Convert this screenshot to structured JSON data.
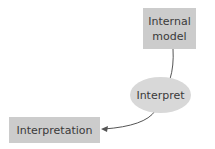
{
  "nodes": {
    "internal_model": {
      "line1": "Internal",
      "line2": "model"
    },
    "interpret": {
      "label": "Interpret"
    },
    "interpretation": {
      "label": "Interpretation"
    }
  },
  "edges": [
    {
      "from": "internal_model",
      "to": "interpret",
      "arrow": false
    },
    {
      "from": "interpret",
      "to": "interpretation",
      "arrow": true
    }
  ],
  "colors": {
    "box": "#cccccc",
    "ellipse": "#d8d8d8",
    "line": "#555555"
  }
}
